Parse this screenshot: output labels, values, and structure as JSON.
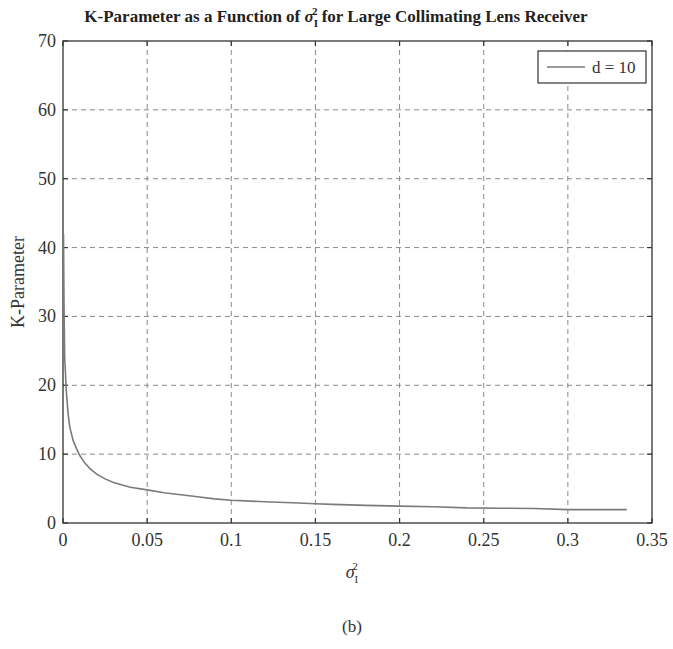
{
  "figure": {
    "title_prefix": "K-Parameter as a Function of ",
    "title_symbol": "σ",
    "title_sub": "I",
    "title_sup": "2",
    "title_suffix": " for Large Collimating Lens Receiver",
    "caption": "(b)",
    "colors": {
      "axes": "#333333",
      "grid": "#8a8a8a",
      "series": "#7a7a7a",
      "text": "#222222"
    }
  },
  "chart_data": {
    "type": "line",
    "xlabel": "σ_I^2",
    "ylabel": "K-Parameter",
    "xlim": [
      0,
      0.35
    ],
    "ylim": [
      0,
      70
    ],
    "xticks": [
      0,
      0.05,
      0.1,
      0.15,
      0.2,
      0.25,
      0.3,
      0.35
    ],
    "xtick_labels": [
      "0",
      "0.05",
      "0.1",
      "0.15",
      "0.2",
      "0.25",
      "0.3",
      "0.35"
    ],
    "yticks": [
      0,
      10,
      20,
      30,
      40,
      50,
      60,
      70
    ],
    "ytick_labels": [
      "0",
      "10",
      "20",
      "30",
      "40",
      "50",
      "60",
      "70"
    ],
    "grid": true,
    "grid_style": "dashed",
    "legend_position": "upper right",
    "series": [
      {
        "name": "d = 10",
        "x": [
          0.0003,
          0.0006,
          0.001,
          0.002,
          0.003,
          0.004,
          0.006,
          0.008,
          0.01,
          0.013,
          0.016,
          0.02,
          0.025,
          0.03,
          0.04,
          0.05,
          0.06,
          0.07,
          0.08,
          0.09,
          0.1,
          0.12,
          0.14,
          0.15,
          0.16,
          0.18,
          0.2,
          0.22,
          0.24,
          0.26,
          0.28,
          0.3,
          0.32,
          0.335
        ],
        "y": [
          42,
          32,
          24,
          19,
          16,
          14,
          12,
          10.8,
          9.8,
          8.7,
          7.9,
          7.1,
          6.4,
          5.9,
          5.2,
          4.8,
          4.4,
          4.1,
          3.8,
          3.5,
          3.3,
          3.1,
          2.9,
          2.8,
          2.7,
          2.55,
          2.45,
          2.35,
          2.2,
          2.15,
          2.1,
          1.95,
          1.95,
          1.95
        ]
      }
    ]
  }
}
